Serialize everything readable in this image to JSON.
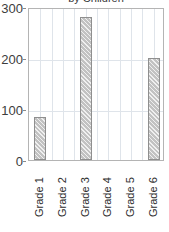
{
  "chart_data": {
    "type": "bar",
    "title": "by Children",
    "title_clipped": true,
    "xlabel": "",
    "ylabel": "",
    "categories": [
      "Grade 1",
      "Grade 2",
      "Grade 3",
      "Grade 4",
      "Grade 5",
      "Grade 6"
    ],
    "values": [
      84,
      0,
      280,
      0,
      0,
      200
    ],
    "series": [
      {
        "name": "by Children",
        "values": [
          84,
          0,
          280,
          0,
          0,
          200
        ]
      }
    ],
    "ylim": [
      0,
      300
    ],
    "ytick_labels": [
      "0",
      "100",
      "200",
      "300"
    ],
    "ytick_values": [
      0,
      100,
      200,
      300
    ],
    "grid": true,
    "legend": "none",
    "bar_fill_color": "#c2c2c2",
    "bar_border_color": "#8f8f8f",
    "gridline_color": "#dfe4ea",
    "axis_color": "#b4b4b4",
    "text_color": "#3d3d3d"
  },
  "y_axis": {
    "ticks": [
      {
        "label": "300",
        "value": 300
      },
      {
        "label": "200",
        "value": 200
      },
      {
        "label": "100",
        "value": 100
      },
      {
        "label": "0",
        "value": 0
      }
    ]
  },
  "x_axis": {
    "ticks": [
      {
        "label": "Grade 1"
      },
      {
        "label": "Grade 2"
      },
      {
        "label": "Grade 3"
      },
      {
        "label": "Grade 4"
      },
      {
        "label": "Grade 5"
      },
      {
        "label": "Grade 6"
      }
    ]
  }
}
